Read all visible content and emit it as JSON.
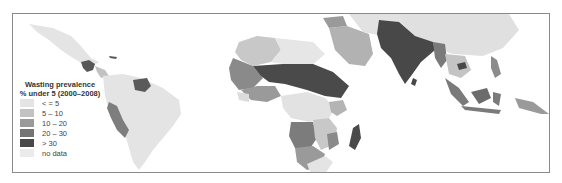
{
  "map": {
    "title_line1": "Wasting prevalence",
    "title_line2": "% under 5 (2000–2008)",
    "legend": [
      {
        "label": "< = 5",
        "color": "#e4e4e4"
      },
      {
        "label": "5 – 10",
        "color": "#c2c2c2"
      },
      {
        "label": "10 – 20",
        "color": "#9a9a9a"
      },
      {
        "label": "20 – 30",
        "color": "#747474"
      },
      {
        "label": "> 30",
        "color": "#484848"
      },
      {
        "label": "no data",
        "color": "#ebebeb"
      }
    ],
    "regions_shown": [
      "Americas (Mexico, Central & South America)",
      "Africa",
      "Middle East",
      "South Asia",
      "Southeast Asia",
      "Indonesia",
      "China"
    ]
  }
}
